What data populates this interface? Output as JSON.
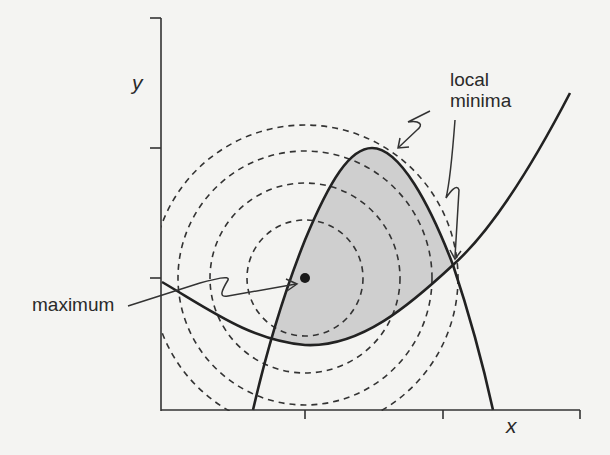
{
  "diagram": {
    "type": "constrained-optimization-contour",
    "axes": {
      "x_label": "x",
      "y_label": "y",
      "x_ticks": 3,
      "y_ticks": 3
    },
    "annotations": {
      "maximum": "maximum",
      "local_minima_line1": "local",
      "local_minima_line2": "minima"
    },
    "contours": {
      "style": "dashed",
      "center": [
        305,
        278
      ],
      "radii": [
        58,
        95,
        127,
        153
      ]
    },
    "feasible_region": {
      "fill": "#cfcfcf",
      "description": "shaded region bounded by an inverted-U curve and a U curve"
    },
    "colors": {
      "background": "#f4f4f2",
      "ink": "#222222",
      "shade": "#cfcfcf"
    }
  }
}
